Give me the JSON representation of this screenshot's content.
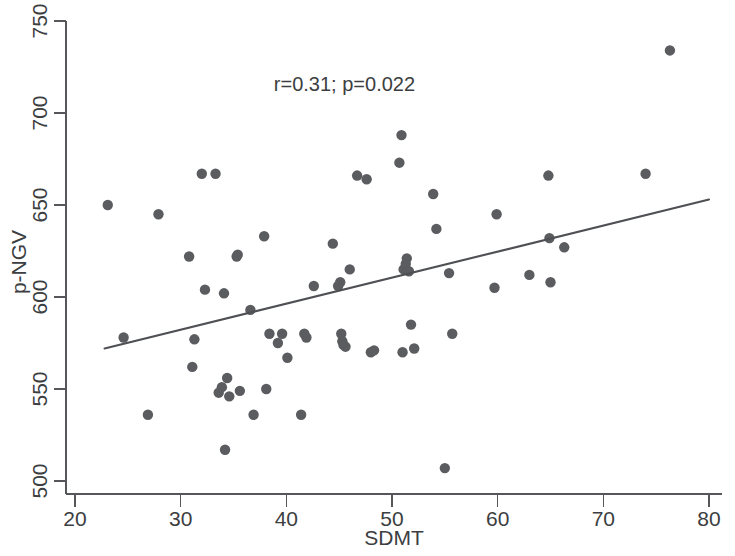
{
  "figure": {
    "background_color": "#ffffff",
    "point_color": "#5a5c5f",
    "line_color": "#4e5053",
    "axis_color": "#55575a"
  },
  "annotation": {
    "stats_label": "r=0.31; p=0.022"
  },
  "chart_data": {
    "type": "scatter",
    "title": "",
    "xlabel": "SDMT",
    "ylabel": "p-NGV",
    "xlim": [
      20,
      80
    ],
    "ylim": [
      500,
      750
    ],
    "xticks": [
      20,
      30,
      40,
      50,
      60,
      70,
      80
    ],
    "yticks": [
      500,
      550,
      600,
      650,
      700,
      750
    ],
    "xtick_labels": [
      "20",
      "30",
      "40",
      "50",
      "60",
      "70",
      "80"
    ],
    "ytick_labels": [
      "500",
      "550",
      "600",
      "650",
      "700",
      "750"
    ],
    "grid": false,
    "legend": null,
    "annotations": [
      {
        "text": "r=0.31; p=0.022",
        "x": 45.5,
        "y": 712
      }
    ],
    "correlation_r": 0.31,
    "p_value": 0.022,
    "n_points": 62,
    "series": [
      {
        "name": "participants",
        "marker": "circle",
        "color": "#5a5c5f",
        "x": [
          23.1,
          24.6,
          26.9,
          27.9,
          30.8,
          31.1,
          31.3,
          32.0,
          32.3,
          33.3,
          33.6,
          33.9,
          34.1,
          34.2,
          34.4,
          34.6,
          35.3,
          35.4,
          35.6,
          36.6,
          36.9,
          37.9,
          38.1,
          38.4,
          39.2,
          39.6,
          40.1,
          41.4,
          41.7,
          41.9,
          42.6,
          44.4,
          44.9,
          45.1,
          45.2,
          45.3,
          45.4,
          45.6,
          46.0,
          46.7,
          47.6,
          48.0,
          48.3,
          50.7,
          50.9,
          51.0,
          51.1,
          51.3,
          51.4,
          51.6,
          51.8,
          52.1,
          53.9,
          54.2,
          55.0,
          55.4,
          55.7,
          59.7,
          59.9,
          63.0,
          64.8,
          64.9,
          65.0,
          66.3,
          74.0,
          76.3
        ],
        "y": [
          650,
          578,
          536,
          645,
          622,
          562,
          577,
          667,
          604,
          667,
          548,
          551,
          602,
          517,
          556,
          546,
          622,
          623,
          549,
          593,
          536,
          633,
          550,
          580,
          575,
          580,
          567,
          536,
          580,
          578,
          606,
          629,
          606,
          608,
          580,
          576,
          574,
          573,
          615,
          666,
          664,
          570,
          571,
          673,
          688,
          570,
          615,
          618,
          621,
          614,
          585,
          572,
          656,
          637,
          507,
          613,
          580,
          605,
          645,
          612,
          666,
          632,
          608,
          627,
          667,
          734
        ]
      }
    ],
    "fit_line": {
      "name": "linear-regression",
      "x_start": 22.8,
      "y_start": 572,
      "x_end": 80.0,
      "y_end": 653,
      "color": "#4e5053"
    }
  }
}
